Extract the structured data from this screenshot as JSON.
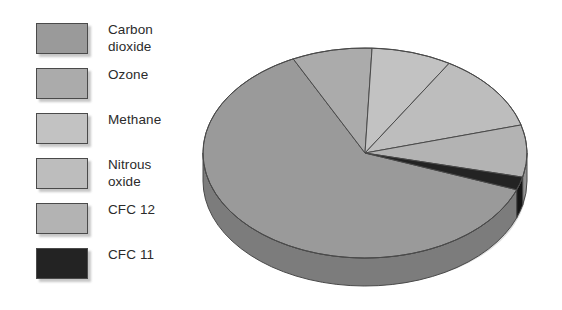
{
  "chart_data": {
    "type": "pie",
    "title": "",
    "subtitle": "",
    "xlabel": "",
    "ylabel": "",
    "legend_position": "left",
    "three_d": true,
    "categories": [
      "Carbon dioxide",
      "Ozone",
      "Methane",
      "Nitrous oxide",
      "CFC 12",
      "CFC 11"
    ],
    "values": [
      62,
      8,
      8,
      12,
      8,
      2
    ],
    "units": "percent",
    "colors": [
      "#9a9a9a",
      "#ababab",
      "#c2c2c2",
      "#bdbdbd",
      "#b3b3b3",
      "#232323"
    ],
    "series": [
      {
        "name": "Contribution to greenhouse effect",
        "values": [
          62,
          8,
          8,
          12,
          8,
          2
        ]
      }
    ],
    "slices": [
      {
        "label": "Carbon dioxide",
        "value": 62,
        "color": "#9a9a9a",
        "side_color": "#7c7c7c"
      },
      {
        "label": "Ozone",
        "value": 8,
        "color": "#ababab",
        "side_color": "#8d8d8d"
      },
      {
        "label": "Methane",
        "value": 8,
        "color": "#c2c2c2",
        "side_color": "#9e9e9e"
      },
      {
        "label": "Nitrous oxide",
        "value": 12,
        "color": "#bdbdbd",
        "side_color": "#9a9a9a"
      },
      {
        "label": "CFC 12",
        "value": 8,
        "color": "#b3b3b3",
        "side_color": "#939393"
      },
      {
        "label": "CFC 11",
        "value": 2,
        "color": "#232323",
        "side_color": "#151515"
      }
    ]
  },
  "legend": {
    "items": [
      {
        "label": "Carbon\ndioxide",
        "color": "#9a9a9a",
        "swatch_name": "legend-swatch-carbon-dioxide"
      },
      {
        "label": "Ozone",
        "color": "#ababab",
        "swatch_name": "legend-swatch-ozone"
      },
      {
        "label": "Methane",
        "color": "#c2c2c2",
        "swatch_name": "legend-swatch-methane"
      },
      {
        "label": "Nitrous\noxide",
        "color": "#bdbdbd",
        "swatch_name": "legend-swatch-nitrous-oxide"
      },
      {
        "label": "CFC 12",
        "color": "#b3b3b3",
        "swatch_name": "legend-swatch-cfc-12"
      },
      {
        "label": "CFC 11",
        "color": "#232323",
        "swatch_name": "legend-swatch-cfc-11"
      }
    ]
  },
  "geometry": {
    "cx": 365,
    "cy": 153,
    "rx": 162,
    "ry": 105,
    "depth": 28
  },
  "palette": {
    "background": "#ffffff",
    "outline": "#4a4a4a",
    "text": "#2b2b2b"
  }
}
